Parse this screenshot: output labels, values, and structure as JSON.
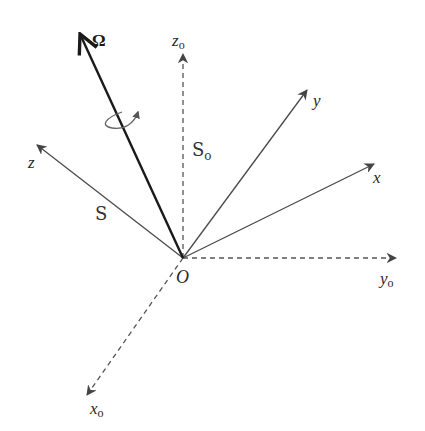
{
  "diagram": {
    "origin": {
      "label": "O",
      "x": 183,
      "y": 258
    },
    "axes": [
      {
        "id": "omega",
        "label": "Ω",
        "style": "solid-thick",
        "tip": [
          79,
          32
        ],
        "label_pos": [
          92,
          46
        ]
      },
      {
        "id": "z0",
        "label": "z",
        "subscript": "o",
        "style": "dashed",
        "tip": [
          183,
          52
        ],
        "label_pos": [
          172,
          46
        ]
      },
      {
        "id": "z",
        "label": "z",
        "style": "solid",
        "tip": [
          35,
          144
        ],
        "label_pos": [
          28,
          168
        ]
      },
      {
        "id": "y",
        "label": "y",
        "style": "solid",
        "tip": [
          308,
          88
        ],
        "label_pos": [
          313,
          106
        ]
      },
      {
        "id": "x",
        "label": "x",
        "style": "solid",
        "tip": [
          376,
          163
        ],
        "label_pos": [
          373,
          183
        ]
      },
      {
        "id": "y0",
        "label": "y",
        "subscript": "o",
        "style": "dashed",
        "tip": [
          398,
          258
        ],
        "label_pos": [
          380,
          284
        ]
      },
      {
        "id": "x0",
        "label": "x",
        "subscript": "o",
        "style": "dashed",
        "tip": [
          86,
          397
        ],
        "label_pos": [
          90,
          414
        ]
      }
    ],
    "frame_labels": [
      {
        "id": "S0",
        "label": "S",
        "subscript": "o",
        "pos": [
          192,
          156
        ]
      },
      {
        "id": "S",
        "label": "S",
        "pos": [
          95,
          220
        ]
      }
    ],
    "rotation_indicator": "curved-arrow-around-omega",
    "colors": {
      "thick_line": "#1a1a1a",
      "line": "#4a4a4a",
      "dashed": "#555555"
    }
  }
}
